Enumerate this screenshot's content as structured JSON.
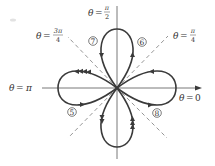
{
  "figure": {
    "type": "polar four-leaved rose with traversal arrows",
    "center": {
      "x": 117,
      "y": 88
    },
    "axis_labels": {
      "theta_0": {
        "lhs": "θ",
        "eq": "=",
        "value": "0"
      },
      "theta_pi": {
        "lhs": "θ",
        "eq": "=",
        "value": "π"
      },
      "theta_pi_over_2": {
        "lhs": "θ",
        "eq": "=",
        "num": "π",
        "den": "2"
      },
      "theta_pi_over_4": {
        "lhs": "θ",
        "eq": "=",
        "num": "π",
        "den": "4"
      },
      "theta_3pi_over_4": {
        "lhs": "θ",
        "eq": "=",
        "num": "3π",
        "den": "4"
      }
    },
    "loop_markers": [
      {
        "label": "5",
        "position": "lower-left",
        "x": 72,
        "y": 112
      },
      {
        "label": "6",
        "position": "upper-right",
        "x": 142,
        "y": 42
      },
      {
        "label": "7",
        "position": "upper-left",
        "x": 93,
        "y": 41
      },
      {
        "label": "8",
        "position": "lower-right",
        "x": 157,
        "y": 113
      }
    ],
    "petals": [
      "top",
      "right",
      "bottom",
      "left"
    ],
    "colors": {
      "curve": "#3a3a3a",
      "axis": "#555555",
      "dashed_lines": "#8a8a8a",
      "background": "#ffffff"
    }
  }
}
